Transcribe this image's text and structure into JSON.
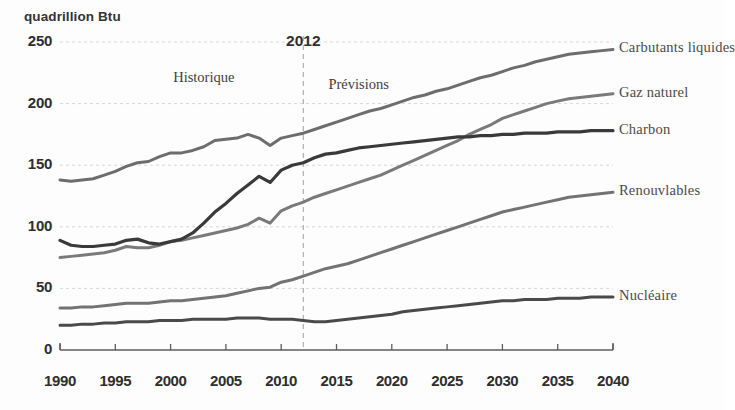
{
  "chart_data": {
    "type": "line",
    "title": "",
    "subtitle": "",
    "unit_label": "quadrillion Btu",
    "xlabel": "",
    "ylabel": "quadrillion Btu",
    "xlim": [
      1990,
      2040
    ],
    "ylim": [
      0,
      250
    ],
    "grid": true,
    "legend_position": "right-inline-end-labels",
    "x_ticks": [
      "1990",
      "1995",
      "2000",
      "2005",
      "2010",
      "2015",
      "2020",
      "2025",
      "2030",
      "2035",
      "2040"
    ],
    "y_ticks": [
      "0",
      "50",
      "100",
      "150",
      "200",
      "250"
    ],
    "annotations": [
      {
        "name": "divider-year",
        "text": "2012",
        "x": 2012,
        "y": 258
      },
      {
        "name": "historical-region",
        "text": "Historique",
        "x": 2003,
        "y": 228
      },
      {
        "name": "projection-region",
        "text": "Prévisions",
        "x": 2017,
        "y": 222
      }
    ],
    "divider": {
      "x": 2012,
      "style": "dashed",
      "color": "#a9a9a9"
    },
    "x": [
      1990,
      1991,
      1992,
      1993,
      1994,
      1995,
      1996,
      1997,
      1998,
      1999,
      2000,
      2001,
      2002,
      2003,
      2004,
      2005,
      2006,
      2007,
      2008,
      2009,
      2010,
      2011,
      2012,
      2013,
      2014,
      2015,
      2016,
      2017,
      2018,
      2019,
      2020,
      2021,
      2022,
      2023,
      2024,
      2025,
      2026,
      2027,
      2028,
      2029,
      2030,
      2031,
      2032,
      2033,
      2034,
      2035,
      2036,
      2037,
      2038,
      2039,
      2040
    ],
    "series": [
      {
        "name": "Carburants liquides",
        "color": "#6d6d6d",
        "width": 3.0,
        "values": [
          138,
          137,
          138,
          139,
          142,
          145,
          149,
          152,
          153,
          157,
          160,
          160,
          162,
          165,
          170,
          171,
          172,
          175,
          172,
          166,
          172,
          174,
          176,
          179,
          182,
          185,
          188,
          191,
          194,
          196,
          199,
          202,
          205,
          207,
          210,
          212,
          215,
          218,
          221,
          223,
          226,
          229,
          231,
          234,
          236,
          238,
          240,
          241,
          242,
          243,
          244
        ]
      },
      {
        "name": "Gaz naturel",
        "color": "#7a7a7a",
        "width": 3.0,
        "values": [
          75,
          76,
          77,
          78,
          79,
          81,
          84,
          83,
          83,
          85,
          88,
          89,
          91,
          93,
          95,
          97,
          99,
          102,
          107,
          103,
          113,
          117,
          120,
          124,
          127,
          130,
          133,
          136,
          139,
          142,
          146,
          150,
          154,
          158,
          162,
          166,
          170,
          175,
          179,
          183,
          188,
          191,
          194,
          197,
          200,
          202,
          204,
          205,
          206,
          207,
          208
        ]
      },
      {
        "name": "Charbon",
        "color": "#3a3a3a",
        "width": 3.2,
        "values": [
          89,
          85,
          84,
          84,
          85,
          86,
          89,
          90,
          87,
          86,
          88,
          90,
          95,
          103,
          112,
          119,
          127,
          134,
          141,
          136,
          146,
          150,
          152,
          156,
          159,
          160,
          162,
          164,
          165,
          166,
          167,
          168,
          169,
          170,
          171,
          172,
          173,
          173,
          174,
          174,
          175,
          175,
          176,
          176,
          176,
          177,
          177,
          177,
          178,
          178,
          178
        ]
      },
      {
        "name": "Renouvlables",
        "color": "#737373",
        "width": 3.0,
        "values": [
          34,
          34,
          35,
          35,
          36,
          37,
          38,
          38,
          38,
          39,
          40,
          40,
          41,
          42,
          43,
          44,
          46,
          48,
          50,
          51,
          55,
          57,
          60,
          63,
          66,
          68,
          70,
          73,
          76,
          79,
          82,
          85,
          88,
          91,
          94,
          97,
          100,
          103,
          106,
          109,
          112,
          114,
          116,
          118,
          120,
          122,
          124,
          125,
          126,
          127,
          128
        ]
      },
      {
        "name": "Nucléaire",
        "color": "#4a4a4a",
        "width": 3.0,
        "values": [
          20,
          20,
          21,
          21,
          22,
          22,
          23,
          23,
          23,
          24,
          24,
          24,
          25,
          25,
          25,
          25,
          26,
          26,
          26,
          25,
          25,
          25,
          24,
          23,
          23,
          24,
          25,
          26,
          27,
          28,
          29,
          31,
          32,
          33,
          34,
          35,
          36,
          37,
          38,
          39,
          40,
          40,
          41,
          41,
          41,
          42,
          42,
          42,
          43,
          43,
          43
        ]
      }
    ],
    "series_labels": [
      {
        "name": "Carburants liquides",
        "text": "Carbutants liquides",
        "anchor_y": 244
      },
      {
        "name": "Gaz naturel",
        "text": "Gaz naturel",
        "anchor_y": 208
      },
      {
        "name": "Charbon",
        "text": "Charbon",
        "anchor_y": 178
      },
      {
        "name": "Renouvlables",
        "text": "Renouvlables",
        "anchor_y": 128
      },
      {
        "name": "Nucléaire",
        "text": "Nucléaire",
        "anchor_y": 43
      }
    ]
  }
}
